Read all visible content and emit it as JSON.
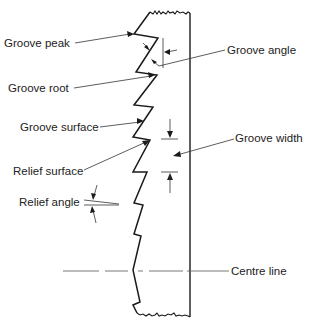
{
  "diagram": {
    "labels": {
      "groove_peak": "Groove peak",
      "groove_root": "Groove root",
      "groove_surface": "Groove surface",
      "relief_surface": "Relief surface",
      "relief_angle": "Relief angle",
      "groove_angle": "Groove angle",
      "groove_width": "Groove width",
      "centre_line": "Centre line"
    },
    "colors": {
      "ink": "#1a1a1a",
      "text": "#222222",
      "background": "#ffffff"
    }
  }
}
